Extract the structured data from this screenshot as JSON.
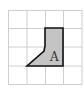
{
  "diagram": {
    "grid": {
      "rows": 4,
      "cols": 4,
      "origin_x": 8,
      "origin_y": 10,
      "cell_size": 18.6,
      "line_color": "#cfcfcf"
    },
    "shape": {
      "label": "A",
      "fill": "#c4c4c4",
      "stroke": "#111111",
      "points": "45,28 63,28 63,66 27,66 44,51 45,46"
    }
  }
}
